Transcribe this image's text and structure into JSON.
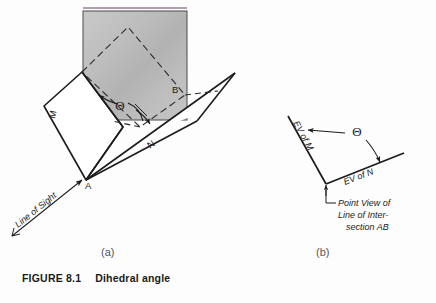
{
  "figure": {
    "caption_label": "FIGURE 8.1",
    "caption_text": "Dihedral angle",
    "panel_a_letter": "(a)",
    "panel_b_letter": "(b)"
  },
  "panel_a": {
    "name": "pictorial-dihedral-angle",
    "plane_m_label": "M",
    "plane_n_label": "N",
    "vertex_a_label": "A",
    "vertex_b_label": "B",
    "angle_label": "Θ",
    "line_of_sight_label": "Line of Sight",
    "shaded_plane_fill": "#b9b9b9",
    "top_accent_color": "#9b7a92",
    "line_color": "#1c1c1c"
  },
  "panel_b": {
    "name": "edge-view-dihedral-angle",
    "ev_of_m_label": "EV of M",
    "ev_of_n_label": "EV of N",
    "angle_label": "Θ",
    "note_line_1": "Point View of",
    "note_line_2": "Line of Inter-",
    "note_line_3": "section AB",
    "line_color": "#1c1c1c"
  }
}
